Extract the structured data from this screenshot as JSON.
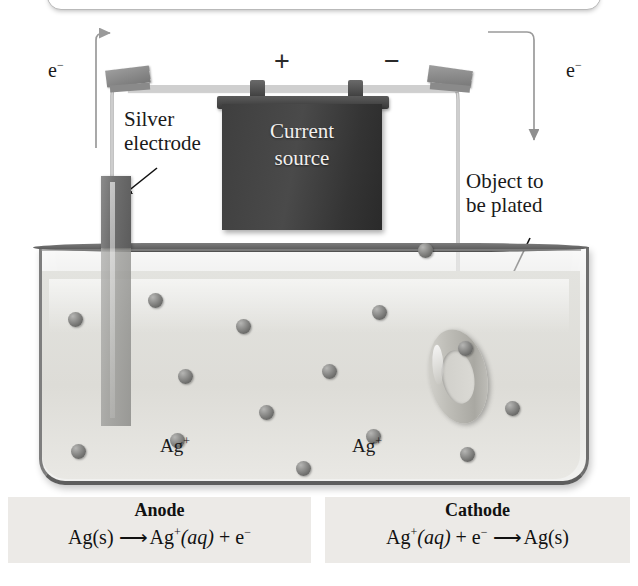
{
  "figure": {
    "battery_label_line1": "Current",
    "battery_label_line2": "source",
    "terminal_positive": "+",
    "terminal_negative": "−",
    "electron_left": "e",
    "electron_left_sup": "−",
    "electron_right": "e",
    "electron_right_sup": "−",
    "label_electrode_line1": "Silver",
    "label_electrode_line2": "electrode",
    "label_object_line1": "Object to",
    "label_object_line2": "be plated",
    "ion_label_left": "Ag",
    "ion_label_left_sup": "+",
    "ion_label_right": "Ag",
    "ion_label_right_sup": "+"
  },
  "equations": {
    "anode": {
      "title": "Anode",
      "reactant": "Ag(s)",
      "arrow": "⟶",
      "product_species": "Ag",
      "product_charge": "+",
      "product_state": "(aq)",
      "plus": "+",
      "electron": "e",
      "electron_charge": "−"
    },
    "cathode": {
      "title": "Cathode",
      "reactant_species": "Ag",
      "reactant_charge": "+",
      "reactant_state": "(aq)",
      "plus": "+",
      "electron": "e",
      "electron_charge": "−",
      "arrow": "⟶",
      "product": "Ag(s)"
    }
  },
  "colors": {
    "battery": "#3f3f3f",
    "tank_liquid": "#e0e0dc",
    "ion": "#8e8e8c",
    "equation_box": "#eceae7",
    "wire": "#9a9a9a",
    "text": "#1a1a1a"
  },
  "ions": [
    {
      "x": 68,
      "y": 312
    },
    {
      "x": 148,
      "y": 293
    },
    {
      "x": 236,
      "y": 319
    },
    {
      "x": 178,
      "y": 369
    },
    {
      "x": 259,
      "y": 405
    },
    {
      "x": 322,
      "y": 364
    },
    {
      "x": 372,
      "y": 305
    },
    {
      "x": 170,
      "y": 433
    },
    {
      "x": 296,
      "y": 461
    },
    {
      "x": 366,
      "y": 429
    },
    {
      "x": 458,
      "y": 341
    },
    {
      "x": 505,
      "y": 401
    },
    {
      "x": 460,
      "y": 447
    },
    {
      "x": 71,
      "y": 444
    },
    {
      "x": 418,
      "y": 243
    }
  ]
}
